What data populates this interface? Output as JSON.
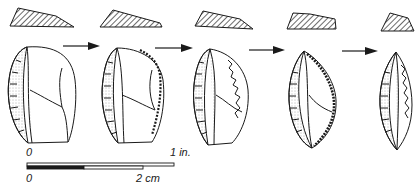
{
  "figure": {
    "stages": [
      {
        "index": 1,
        "label": "stage-1"
      },
      {
        "index": 2,
        "label": "stage-2"
      },
      {
        "index": 3,
        "label": "stage-3"
      },
      {
        "index": 4,
        "label": "stage-4"
      },
      {
        "index": 5,
        "label": "stage-5"
      }
    ],
    "arrows_count": 4
  },
  "scale": {
    "inch_zero": "0",
    "inch_label": "1 in.",
    "cm_zero": "0",
    "cm_label": "2 cm"
  },
  "colors": {
    "ink": "#1a1a1a",
    "paper": "#ffffff"
  }
}
